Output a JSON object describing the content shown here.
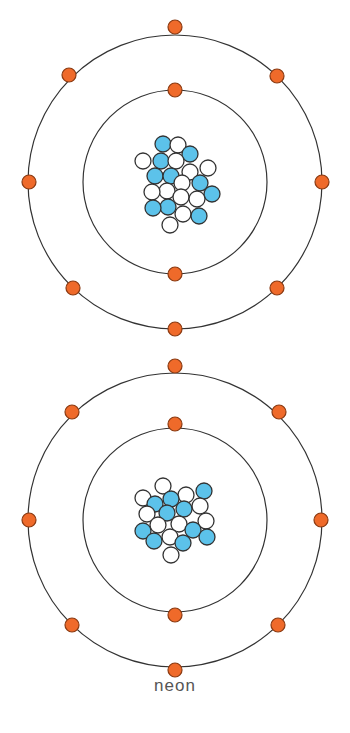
{
  "caption": "neon",
  "colors": {
    "orbit": "#333333",
    "electron_fill": "#ef6a2a",
    "electron_stroke": "#8a3a12",
    "proton_fill": "#5cc2ea",
    "neutron_fill": "#ffffff",
    "particle_stroke": "#333333"
  },
  "atoms": [
    {
      "name": "atom-top",
      "center": [
        175,
        182
      ],
      "shells": [
        {
          "radius": 92,
          "electrons": [
            [
              175,
              90
            ],
            [
              175,
              274
            ]
          ]
        },
        {
          "radius": 147,
          "electrons": [
            [
              175,
              27
            ],
            [
              277,
              76
            ],
            [
              322,
              182
            ],
            [
              277,
              288
            ],
            [
              175,
              329
            ],
            [
              73,
              288
            ],
            [
              29,
              182
            ],
            [
              69,
              75
            ]
          ]
        }
      ],
      "protons": [
        [
          163,
          144
        ],
        [
          190,
          154
        ],
        [
          161,
          161
        ],
        [
          155,
          176
        ],
        [
          171,
          176
        ],
        [
          200,
          183
        ],
        [
          212,
          194
        ],
        [
          153,
          208
        ],
        [
          168,
          207
        ],
        [
          199,
          216
        ]
      ],
      "neutrons": [
        [
          178,
          145
        ],
        [
          143,
          161
        ],
        [
          176,
          161
        ],
        [
          190,
          172
        ],
        [
          208,
          168
        ],
        [
          182,
          183
        ],
        [
          152,
          192
        ],
        [
          167,
          191
        ],
        [
          181,
          197
        ],
        [
          197,
          199
        ],
        [
          183,
          214
        ],
        [
          170,
          225
        ]
      ]
    },
    {
      "name": "atom-bottom",
      "center": [
        175,
        520
      ],
      "shells": [
        {
          "radius": 92,
          "electrons": [
            [
              175,
              424
            ],
            [
              175,
              615
            ]
          ]
        },
        {
          "radius": 147,
          "electrons": [
            [
              175,
              366
            ],
            [
              279,
              412
            ],
            [
              321,
              520
            ],
            [
              278,
              625
            ],
            [
              175,
              670
            ],
            [
              72,
              625
            ],
            [
              29,
              520
            ],
            [
              72,
              412
            ]
          ]
        }
      ],
      "protons": [
        [
          171,
          499
        ],
        [
          155,
          504
        ],
        [
          204,
          491
        ],
        [
          184,
          509
        ],
        [
          167,
          513
        ],
        [
          143,
          531
        ],
        [
          193,
          530
        ],
        [
          154,
          541
        ],
        [
          183,
          543
        ],
        [
          207,
          537
        ]
      ],
      "neutrons": [
        [
          163,
          486
        ],
        [
          143,
          498
        ],
        [
          186,
          495
        ],
        [
          200,
          506
        ],
        [
          147,
          514
        ],
        [
          158,
          525
        ],
        [
          179,
          524
        ],
        [
          206,
          521
        ],
        [
          170,
          537
        ],
        [
          171,
          555
        ]
      ]
    }
  ]
}
